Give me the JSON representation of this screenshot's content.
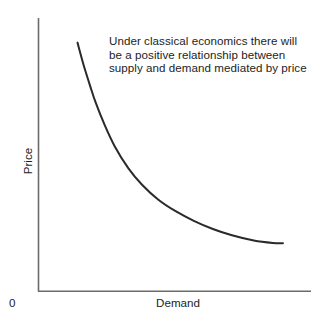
{
  "figure": {
    "background_color": "#ffffff",
    "width": 323,
    "height": 327
  },
  "annotation": {
    "text": "Under classical economics there will be a positive relationship between supply and demand mediated by price",
    "color": "#1d1d1d"
  },
  "labels": {
    "y_axis": "Price",
    "x_axis": "Demand",
    "origin": "0"
  },
  "chart_data": {
    "type": "line",
    "title": "",
    "subtitle": "",
    "xlabel": "Demand",
    "ylabel": "Price",
    "xlim": [
      0,
      100
    ],
    "ylim": [
      0,
      100
    ],
    "grid": false,
    "legend": null,
    "axis_color": "#6b6b6b",
    "line_color": "#2a2a2a",
    "line_width": 2,
    "annotations": [
      {
        "text": "Under classical economics there will be a positive relationship between supply and demand mediated by price",
        "x": 26,
        "y": 92
      }
    ],
    "series": [
      {
        "name": "Demand curve",
        "x": [
          14.3,
          16.5,
          19.0,
          21.0,
          24.0,
          28.0,
          33.0,
          38.0,
          44.0,
          50.0,
          57.0,
          64.0,
          71.0,
          79.0,
          86.0,
          89.7
        ],
        "y": [
          91.0,
          83.0,
          75.0,
          69.0,
          61.5,
          53.0,
          45.0,
          39.0,
          33.5,
          29.5,
          25.8,
          22.8,
          20.5,
          18.6,
          17.7,
          17.6
        ]
      }
    ],
    "xticks": [],
    "yticks": [],
    "xticklabels": [],
    "yticklabels": []
  }
}
